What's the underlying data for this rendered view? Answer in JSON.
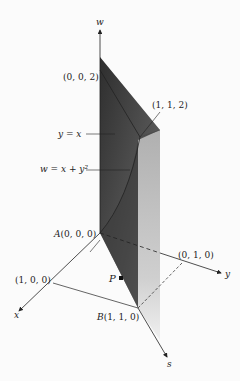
{
  "figure": {
    "axes": {
      "w": "w",
      "x": "x",
      "y": "y",
      "s": "s"
    },
    "points": {
      "top": "(0, 0, 2)",
      "corner": "(1, 1, 2)",
      "origin_name": "A",
      "origin": "(0, 0, 0)",
      "x_unit": "(1, 0, 0)",
      "y_unit": "(0, 1, 0)",
      "b_name": "B",
      "b": "(1, 1, 0)",
      "p": "P"
    },
    "curve_labels": {
      "line": "y = x",
      "surface": "w = x + y²"
    },
    "colors": {
      "dark_face": "#3a3a3a",
      "mid_face": "#8a8a8a",
      "light_face": "#c8c8c8",
      "axis": "#222222"
    }
  }
}
